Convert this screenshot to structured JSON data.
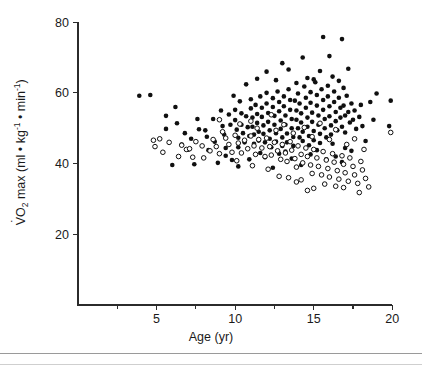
{
  "figure": {
    "background": "#ffffff",
    "ink_color": "#101010"
  },
  "chart_data": {
    "type": "scatter",
    "title": "",
    "subtitle": "",
    "xlabel": "Age (yr)",
    "ylabel": "VO2 max (ml • kg-1 • min-1)",
    "ylabel_parts": {
      "v_dot": "V",
      "o": "O",
      "o_sub": "2",
      "max": " max (ml • kg",
      "sup1": "-1",
      "mid": " • min",
      "sup2": "-1",
      "close": ")"
    },
    "xlim": [
      0,
      21
    ],
    "ylim": [
      0,
      84
    ],
    "xticks": [
      5,
      10,
      15,
      20
    ],
    "xtick_labels": [
      "5",
      "10",
      "15",
      "20"
    ],
    "xminor_ticks": [
      2.5,
      7.5,
      12.5,
      17.5
    ],
    "yticks": [
      20,
      40,
      60,
      80
    ],
    "ytick_labels": [
      "20",
      "40",
      "60",
      "80"
    ],
    "grid": false,
    "legend_position": "none",
    "marker_radius_px": 2.3,
    "series": [
      {
        "name": "filled-circles",
        "marker": "filled-circle",
        "color": "#101010",
        "points": [
          [
            3.9,
            59.2
          ],
          [
            4.6,
            59.4
          ],
          [
            5.6,
            53.5
          ],
          [
            5.6,
            49.8
          ],
          [
            6.2,
            56.0
          ],
          [
            6.3,
            51.4
          ],
          [
            6.0,
            39.6
          ],
          [
            6.6,
            45.4
          ],
          [
            7.0,
            43.9
          ],
          [
            7.4,
            39.8
          ],
          [
            7.6,
            52.6
          ],
          [
            7.7,
            49.7
          ],
          [
            8.1,
            49.4
          ],
          [
            8.3,
            43.8
          ],
          [
            8.6,
            52.6
          ],
          [
            8.7,
            46.2
          ],
          [
            9.1,
            55.0
          ],
          [
            9.2,
            50.6
          ],
          [
            9.3,
            48.2
          ],
          [
            9.4,
            44.4
          ],
          [
            9.6,
            53.9
          ],
          [
            9.7,
            51.0
          ],
          [
            9.9,
            59.2
          ],
          [
            10.0,
            55.2
          ],
          [
            10.0,
            52.3
          ],
          [
            10.1,
            49.6
          ],
          [
            10.2,
            47.3
          ],
          [
            10.2,
            44.6
          ],
          [
            10.3,
            57.6
          ],
          [
            10.4,
            54.2
          ],
          [
            10.4,
            51.0
          ],
          [
            10.5,
            48.6
          ],
          [
            10.6,
            46.0
          ],
          [
            10.7,
            53.4
          ],
          [
            10.8,
            50.3
          ],
          [
            10.9,
            47.8
          ],
          [
            11.0,
            58.2
          ],
          [
            11.0,
            55.6
          ],
          [
            11.1,
            53.0
          ],
          [
            11.1,
            50.4
          ],
          [
            11.2,
            48.2
          ],
          [
            11.2,
            45.6
          ],
          [
            11.3,
            56.6
          ],
          [
            11.4,
            54.0
          ],
          [
            11.4,
            51.5
          ],
          [
            11.5,
            49.0
          ],
          [
            11.5,
            46.5
          ],
          [
            11.6,
            59.0
          ],
          [
            11.7,
            55.8
          ],
          [
            11.7,
            53.2
          ],
          [
            11.8,
            50.8
          ],
          [
            11.8,
            48.4
          ],
          [
            11.9,
            46.0
          ],
          [
            12.0,
            60.0
          ],
          [
            12.0,
            57.0
          ],
          [
            12.1,
            54.3
          ],
          [
            12.1,
            51.8
          ],
          [
            12.2,
            49.4
          ],
          [
            12.2,
            47.0
          ],
          [
            12.3,
            44.6
          ],
          [
            12.4,
            58.5
          ],
          [
            12.4,
            56.0
          ],
          [
            12.5,
            53.5
          ],
          [
            12.5,
            51.0
          ],
          [
            12.6,
            48.6
          ],
          [
            12.6,
            46.2
          ],
          [
            12.7,
            60.4
          ],
          [
            12.8,
            57.4
          ],
          [
            12.8,
            54.8
          ],
          [
            12.9,
            52.2
          ],
          [
            12.9,
            49.8
          ],
          [
            13.0,
            47.4
          ],
          [
            13.0,
            45.0
          ],
          [
            13.1,
            59.0
          ],
          [
            13.1,
            56.2
          ],
          [
            13.2,
            53.6
          ],
          [
            13.2,
            51.0
          ],
          [
            13.3,
            48.5
          ],
          [
            13.3,
            46.0
          ],
          [
            13.4,
            61.0
          ],
          [
            13.5,
            58.0
          ],
          [
            13.5,
            55.2
          ],
          [
            13.6,
            52.6
          ],
          [
            13.6,
            50.0
          ],
          [
            13.7,
            47.5
          ],
          [
            13.7,
            45.0
          ],
          [
            13.8,
            57.8
          ],
          [
            13.9,
            55.0
          ],
          [
            13.9,
            52.4
          ],
          [
            14.0,
            59.8
          ],
          [
            14.0,
            50.0
          ],
          [
            14.1,
            47.4
          ],
          [
            14.1,
            57.0
          ],
          [
            14.2,
            54.2
          ],
          [
            14.2,
            51.6
          ],
          [
            14.3,
            49.0
          ],
          [
            14.3,
            46.4
          ],
          [
            14.4,
            61.8
          ],
          [
            14.5,
            58.6
          ],
          [
            14.5,
            55.8
          ],
          [
            14.6,
            53.0
          ],
          [
            14.6,
            50.4
          ],
          [
            14.7,
            47.8
          ],
          [
            14.7,
            45.2
          ],
          [
            14.8,
            60.2
          ],
          [
            14.8,
            57.2
          ],
          [
            14.9,
            54.4
          ],
          [
            14.9,
            51.8
          ],
          [
            15.0,
            49.2
          ],
          [
            15.0,
            46.6
          ],
          [
            15.1,
            63.0
          ],
          [
            15.2,
            59.4
          ],
          [
            15.2,
            56.4
          ],
          [
            15.3,
            53.6
          ],
          [
            15.3,
            51.0
          ],
          [
            15.4,
            48.4
          ],
          [
            15.4,
            45.8
          ],
          [
            15.5,
            61.0
          ],
          [
            15.6,
            58.0
          ],
          [
            15.6,
            55.2
          ],
          [
            15.7,
            52.6
          ],
          [
            15.7,
            50.0
          ],
          [
            15.8,
            47.4
          ],
          [
            15.9,
            62.0
          ],
          [
            15.9,
            59.0
          ],
          [
            16.0,
            56.2
          ],
          [
            16.0,
            53.4
          ],
          [
            16.1,
            50.8
          ],
          [
            16.1,
            48.2
          ],
          [
            16.2,
            45.6
          ],
          [
            16.3,
            60.4
          ],
          [
            16.3,
            57.4
          ],
          [
            16.4,
            54.6
          ],
          [
            16.4,
            52.0
          ],
          [
            16.5,
            49.4
          ],
          [
            16.6,
            63.4
          ],
          [
            16.6,
            58.6
          ],
          [
            16.7,
            55.8
          ],
          [
            16.7,
            53.0
          ],
          [
            16.8,
            50.4
          ],
          [
            16.9,
            61.4
          ],
          [
            16.9,
            56.4
          ],
          [
            17.0,
            53.6
          ],
          [
            17.0,
            48.8
          ],
          [
            17.1,
            59.2
          ],
          [
            17.2,
            54.6
          ],
          [
            17.3,
            51.6
          ],
          [
            17.4,
            57.0
          ],
          [
            17.5,
            52.4
          ],
          [
            17.6,
            55.0
          ],
          [
            17.7,
            49.8
          ],
          [
            17.9,
            53.2
          ],
          [
            18.0,
            56.6
          ],
          [
            18.1,
            50.6
          ],
          [
            13.0,
            68.4
          ],
          [
            13.4,
            66.6
          ],
          [
            14.3,
            70.0
          ],
          [
            15.0,
            63.8
          ],
          [
            15.4,
            66.2
          ],
          [
            15.6,
            75.8
          ],
          [
            16.0,
            70.4
          ],
          [
            16.2,
            64.6
          ],
          [
            16.8,
            75.2
          ],
          [
            12.6,
            63.6
          ],
          [
            11.4,
            64.0
          ],
          [
            10.7,
            62.4
          ],
          [
            17.2,
            66.8
          ],
          [
            13.9,
            62.8
          ],
          [
            14.6,
            64.2
          ],
          [
            12.0,
            66.0
          ],
          [
            18.6,
            57.4
          ],
          [
            19.0,
            59.8
          ],
          [
            19.9,
            57.8
          ],
          [
            19.8,
            50.6
          ],
          [
            18.8,
            52.4
          ],
          [
            18.3,
            46.4
          ],
          [
            17.4,
            43.6
          ],
          [
            16.4,
            42.0
          ],
          [
            15.8,
            41.2
          ],
          [
            14.8,
            42.6
          ],
          [
            13.6,
            41.4
          ],
          [
            12.8,
            42.8
          ],
          [
            11.9,
            41.8
          ],
          [
            10.9,
            41.2
          ],
          [
            9.8,
            41.0
          ],
          [
            8.9,
            40.2
          ],
          [
            10.2,
            39.2
          ],
          [
            12.4,
            38.8
          ],
          [
            14.2,
            39.6
          ],
          [
            16.8,
            40.4
          ],
          [
            11.6,
            43.0
          ],
          [
            13.2,
            43.4
          ],
          [
            15.2,
            43.8
          ],
          [
            17.0,
            44.4
          ],
          [
            9.4,
            42.2
          ],
          [
            8.2,
            47.6
          ],
          [
            7.2,
            47.0
          ],
          [
            6.8,
            48.6
          ]
        ]
      },
      {
        "name": "open-circles",
        "marker": "open-circle",
        "color": "#101010",
        "points": [
          [
            4.8,
            46.6
          ],
          [
            4.9,
            44.8
          ],
          [
            5.4,
            43.2
          ],
          [
            5.8,
            46.0
          ],
          [
            6.4,
            42.0
          ],
          [
            6.9,
            44.0
          ],
          [
            7.1,
            44.2
          ],
          [
            7.3,
            41.8
          ],
          [
            7.5,
            46.2
          ],
          [
            7.9,
            45.0
          ],
          [
            8.4,
            43.6
          ],
          [
            8.8,
            44.8
          ],
          [
            9.0,
            52.4
          ],
          [
            9.4,
            47.2
          ],
          [
            9.6,
            45.4
          ],
          [
            9.8,
            43.2
          ],
          [
            10.0,
            48.0
          ],
          [
            10.2,
            45.8
          ],
          [
            10.4,
            43.0
          ],
          [
            10.6,
            46.6
          ],
          [
            10.8,
            44.2
          ],
          [
            11.0,
            47.8
          ],
          [
            11.2,
            45.0
          ],
          [
            11.3,
            42.6
          ],
          [
            11.5,
            46.8
          ],
          [
            11.7,
            44.4
          ],
          [
            11.9,
            42.0
          ],
          [
            12.0,
            47.2
          ],
          [
            12.2,
            44.8
          ],
          [
            12.3,
            42.4
          ],
          [
            12.5,
            46.0
          ],
          [
            12.7,
            43.6
          ],
          [
            12.9,
            41.2
          ],
          [
            13.0,
            45.4
          ],
          [
            13.2,
            43.0
          ],
          [
            13.3,
            40.6
          ],
          [
            13.5,
            46.2
          ],
          [
            13.6,
            43.8
          ],
          [
            13.8,
            41.4
          ],
          [
            13.9,
            39.0
          ],
          [
            14.0,
            45.0
          ],
          [
            14.2,
            42.6
          ],
          [
            14.3,
            40.2
          ],
          [
            14.5,
            44.4
          ],
          [
            14.6,
            42.0
          ],
          [
            14.8,
            39.6
          ],
          [
            14.9,
            37.2
          ],
          [
            15.0,
            44.0
          ],
          [
            15.2,
            41.6
          ],
          [
            15.3,
            39.2
          ],
          [
            15.5,
            36.8
          ],
          [
            15.6,
            43.4
          ],
          [
            15.8,
            41.0
          ],
          [
            15.9,
            38.6
          ],
          [
            16.0,
            36.2
          ],
          [
            16.2,
            42.8
          ],
          [
            16.3,
            40.4
          ],
          [
            16.5,
            38.0
          ],
          [
            16.6,
            35.6
          ],
          [
            16.8,
            42.2
          ],
          [
            16.9,
            39.8
          ],
          [
            17.0,
            37.4
          ],
          [
            17.2,
            35.0
          ],
          [
            17.3,
            41.6
          ],
          [
            17.5,
            39.2
          ],
          [
            17.6,
            36.8
          ],
          [
            17.8,
            34.4
          ],
          [
            18.0,
            40.6
          ],
          [
            18.1,
            38.2
          ],
          [
            18.3,
            35.8
          ],
          [
            18.5,
            33.4
          ],
          [
            11.0,
            52.0
          ],
          [
            12.3,
            53.8
          ],
          [
            13.1,
            51.0
          ],
          [
            14.4,
            50.2
          ],
          [
            15.4,
            51.4
          ],
          [
            16.4,
            49.6
          ],
          [
            10.3,
            51.2
          ],
          [
            9.2,
            49.0
          ],
          [
            17.6,
            47.0
          ],
          [
            18.2,
            44.0
          ],
          [
            19.9,
            48.8
          ],
          [
            13.7,
            48.6
          ],
          [
            12.6,
            49.4
          ],
          [
            11.4,
            50.0
          ],
          [
            14.9,
            47.6
          ],
          [
            16.0,
            46.8
          ],
          [
            17.1,
            45.4
          ],
          [
            15.7,
            34.2
          ],
          [
            16.4,
            33.6
          ],
          [
            14.2,
            35.4
          ],
          [
            13.4,
            36.0
          ],
          [
            12.1,
            38.4
          ],
          [
            11.1,
            39.4
          ],
          [
            10.1,
            40.8
          ],
          [
            9.0,
            42.8
          ],
          [
            15.0,
            33.0
          ],
          [
            16.9,
            33.2
          ],
          [
            17.9,
            31.8
          ],
          [
            14.6,
            32.4
          ],
          [
            13.9,
            34.8
          ],
          [
            12.8,
            36.4
          ],
          [
            8.6,
            46.8
          ],
          [
            8.0,
            41.6
          ],
          [
            6.6,
            45.2
          ],
          [
            5.2,
            47.0
          ]
        ]
      }
    ]
  },
  "footer": {
    "rule_present": true
  }
}
